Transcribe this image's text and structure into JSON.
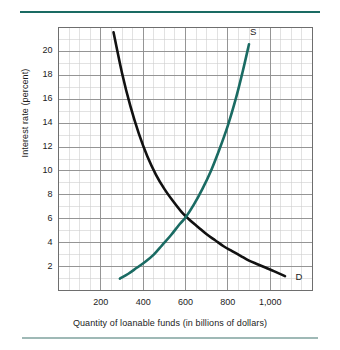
{
  "figure": {
    "background_color": "#ffffff",
    "rule_top_color": "#1a6b63",
    "rule_bottom_color": "#9fb9b6"
  },
  "chart_data": {
    "type": "line",
    "title": "",
    "xlabel": "Quantity of loanable funds (in billions of dollars)",
    "ylabel": "Interest rate (percent)",
    "xlim": [
      0,
      1200
    ],
    "ylim": [
      0,
      22
    ],
    "grid": true,
    "grid_major_color": "#8d8d8d",
    "grid_minor_color": "#cfcfcf",
    "frame_color": "#6e6e6e",
    "legend_position": "inline-curve-labels",
    "xticks": [
      200,
      400,
      600,
      800,
      1000
    ],
    "xtick_labels": [
      "200",
      "400",
      "600",
      "800",
      "1,000"
    ],
    "yticks": [
      2,
      4,
      6,
      8,
      10,
      12,
      14,
      16,
      18,
      20
    ],
    "ytick_labels": [
      "2",
      "4",
      "6",
      "8",
      "10",
      "12",
      "14",
      "16",
      "18",
      "20"
    ],
    "x_minor_step": 50,
    "y_minor_step": 1,
    "equilibrium": {
      "x": 600,
      "y": 6,
      "label": ""
    },
    "series": [
      {
        "name": "Demand",
        "label": "D",
        "color": "#111111",
        "width": 2.6,
        "label_x": 1120,
        "label_y": 1.1,
        "points": [
          [
            260,
            21.6
          ],
          [
            300,
            18.2
          ],
          [
            340,
            15.4
          ],
          [
            380,
            13.1
          ],
          [
            420,
            11.2
          ],
          [
            460,
            9.7
          ],
          [
            500,
            8.5
          ],
          [
            540,
            7.5
          ],
          [
            580,
            6.6
          ],
          [
            620,
            5.9
          ],
          [
            660,
            5.3
          ],
          [
            700,
            4.7
          ],
          [
            740,
            4.2
          ],
          [
            780,
            3.7
          ],
          [
            820,
            3.3
          ],
          [
            860,
            2.9
          ],
          [
            900,
            2.5
          ],
          [
            940,
            2.2
          ],
          [
            980,
            1.9
          ],
          [
            1020,
            1.6
          ],
          [
            1070,
            1.2
          ]
        ]
      },
      {
        "name": "Supply",
        "label": "S",
        "color": "#1a6b63",
        "width": 2.6,
        "label_x": 905,
        "label_y": 21.6,
        "points": [
          [
            290,
            1.0
          ],
          [
            330,
            1.4
          ],
          [
            370,
            1.9
          ],
          [
            410,
            2.4
          ],
          [
            450,
            3.0
          ],
          [
            490,
            3.8
          ],
          [
            530,
            4.6
          ],
          [
            570,
            5.5
          ],
          [
            600,
            6.1
          ],
          [
            640,
            7.2
          ],
          [
            680,
            8.5
          ],
          [
            720,
            10.0
          ],
          [
            760,
            11.8
          ],
          [
            800,
            13.8
          ],
          [
            840,
            16.2
          ],
          [
            870,
            18.3
          ],
          [
            900,
            20.6
          ]
        ]
      }
    ]
  }
}
